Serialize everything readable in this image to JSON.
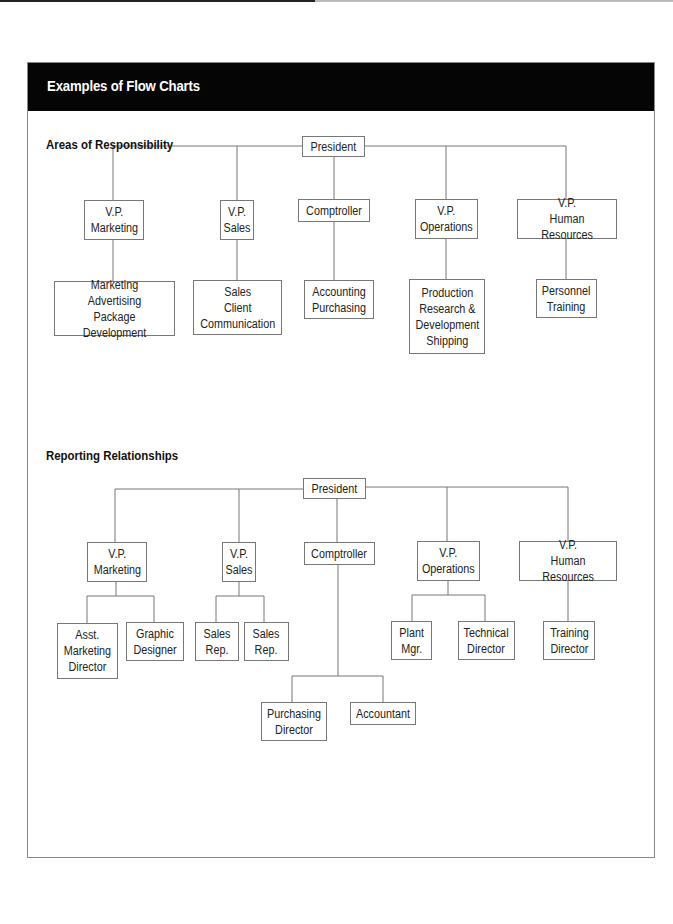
{
  "panel": {
    "title": "Examples of Flow Charts"
  },
  "chart1": {
    "title": "Areas of Responsibility",
    "president": "President",
    "vps": [
      {
        "label": "V.P.\nMarketing",
        "duties": "Marketing\nAdvertising\nPackage Development"
      },
      {
        "label": "V.P.\nSales",
        "duties": "Sales\nClient\nCommunication"
      },
      {
        "label": "Comptroller",
        "duties": "Accounting\nPurchasing"
      },
      {
        "label": "V.P.\nOperations",
        "duties": "Production\nResearch &\nDevelopment\nShipping"
      },
      {
        "label": "V.P.\nHuman Resources",
        "duties": "Personnel\nTraining"
      }
    ]
  },
  "chart2": {
    "title": "Reporting Relationships",
    "president": "President",
    "vps": [
      {
        "label": "V.P.\nMarketing",
        "reports": [
          "Asst.\nMarketing\nDirector",
          "Graphic\nDesigner"
        ]
      },
      {
        "label": "V.P.\nSales",
        "reports": [
          "Sales\nRep.",
          "Sales\nRep."
        ]
      },
      {
        "label": "Comptroller",
        "reports": [
          "Purchasing\nDirector",
          "Accountant"
        ]
      },
      {
        "label": "V.P.\nOperations",
        "reports": [
          "Plant\nMgr.",
          "Technical\nDirector"
        ]
      },
      {
        "label": "V.P.\nHuman Resources",
        "reports": [
          "Training\nDirector"
        ]
      }
    ]
  }
}
